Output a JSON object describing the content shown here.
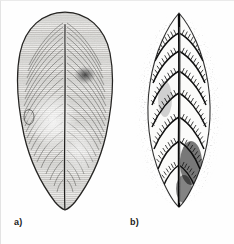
{
  "figure": {
    "background_color": "#fefefe",
    "ink_color": "#1b1b1b",
    "width": 234,
    "height": 244,
    "panels": [
      {
        "id": "a",
        "label": "a)",
        "specimen_name": "fossil-leaf-specimen-a",
        "outline_shape": "ovate",
        "venation": "fine parallel striations radiating from midrib",
        "midrib": "present, vertical, full length",
        "apex": "rounded",
        "base": "acute, tapering",
        "surface_marks": "dark blotch upper right, small oval depression left margin",
        "tone": "light gray with dense hatching"
      },
      {
        "id": "b",
        "label": "b)",
        "specimen_name": "fossil-leaf-specimen-b",
        "outline_shape": "elongate elliptic",
        "venation": "pinnate, strong midrib with oblique lateral veins and fine cross-hatching",
        "midrib": "present, prominent, dark",
        "apex": "acute",
        "base": "narrowed",
        "surface_marks": "stippled matrix halo surrounding leaf",
        "tone": "high contrast black on white"
      }
    ]
  }
}
